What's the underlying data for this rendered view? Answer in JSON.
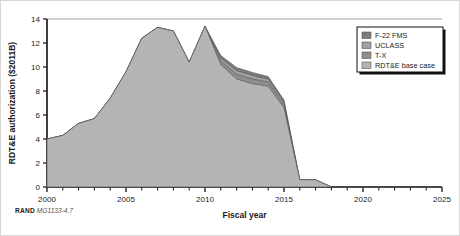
{
  "figure": {
    "source_brand": "RAND",
    "source_figure_number": "MG1133-4.7"
  },
  "legend": {
    "position": "top-right",
    "items": [
      {
        "label": "F-22 FMS",
        "color": "#7d7d7d"
      },
      {
        "label": "UCLASS",
        "color": "#a0a0a0"
      },
      {
        "label": "T-X",
        "color": "#8e8e8e"
      },
      {
        "label": "RDT&E base case",
        "color": "#b4b4b4"
      }
    ]
  },
  "chart_data": {
    "type": "area",
    "stacked": true,
    "title": "",
    "xlabel": "Fiscal year",
    "ylabel": "RDT&E authorization ($2011B)",
    "xlim": [
      2000,
      2025
    ],
    "ylim": [
      0,
      14
    ],
    "ytick_values": [
      0,
      2,
      4,
      6,
      8,
      10,
      12,
      14
    ],
    "ytick_labels": [
      "0",
      "2",
      "4",
      "6",
      "8",
      "10",
      "12",
      "14"
    ],
    "xtick_values": [
      2000,
      2005,
      2010,
      2015,
      2020,
      2025
    ],
    "xtick_labels": [
      "2000",
      "2005",
      "2010",
      "2015",
      "2020",
      "2025"
    ],
    "xtick_minor_step": 1,
    "grid": false,
    "x": [
      2000,
      2001,
      2002,
      2003,
      2004,
      2005,
      2006,
      2007,
      2008,
      2009,
      2010,
      2011,
      2012,
      2013,
      2014,
      2015,
      2016,
      2017,
      2018,
      2019,
      2020,
      2021,
      2022,
      2023,
      2024,
      2025
    ],
    "series": [
      {
        "name": "RDT&E base case",
        "color": "#b4b4b4",
        "values": [
          4.0,
          4.3,
          5.3,
          5.7,
          7.4,
          9.6,
          12.4,
          13.3,
          13.0,
          10.4,
          13.4,
          10.2,
          9.0,
          8.6,
          8.4,
          6.6,
          0.6,
          0.6,
          0.0,
          0.0,
          0.0,
          0.0,
          0.0,
          0.0,
          0.0,
          0.0
        ]
      },
      {
        "name": "T-X",
        "color": "#8e8e8e",
        "values": [
          0,
          0,
          0,
          0,
          0,
          0,
          0,
          0,
          0,
          0,
          0,
          0.3,
          0.4,
          0.4,
          0.35,
          0.3,
          0.0,
          0.0,
          0.0,
          0,
          0,
          0,
          0,
          0,
          0,
          0
        ]
      },
      {
        "name": "UCLASS",
        "color": "#a0a0a0",
        "values": [
          0,
          0,
          0,
          0,
          0,
          0,
          0,
          0,
          0,
          0,
          0,
          0.25,
          0.3,
          0.3,
          0.25,
          0.2,
          0.0,
          0.0,
          0.0,
          0,
          0,
          0,
          0,
          0,
          0,
          0
        ]
      },
      {
        "name": "F-22 FMS",
        "color": "#7d7d7d",
        "values": [
          0,
          0,
          0,
          0,
          0,
          0,
          0,
          0,
          0,
          0,
          0,
          0.2,
          0.25,
          0.25,
          0.2,
          0.15,
          0.0,
          0.0,
          0.0,
          0,
          0,
          0,
          0,
          0,
          0,
          0
        ]
      }
    ]
  }
}
